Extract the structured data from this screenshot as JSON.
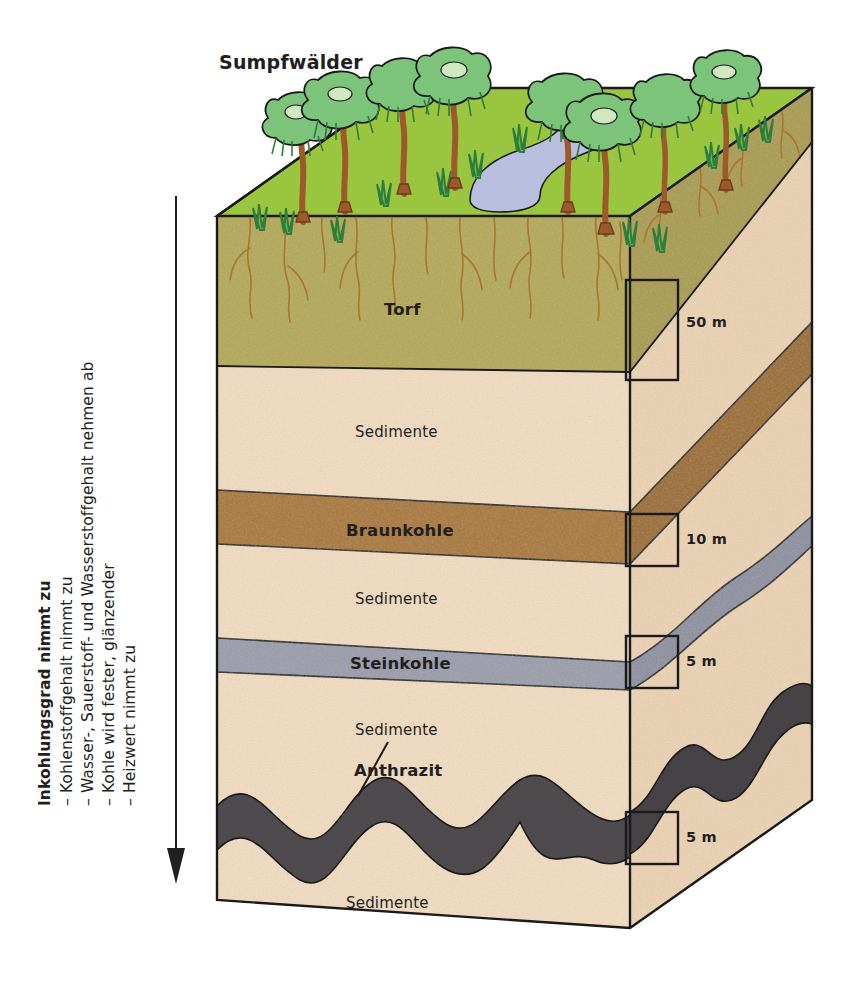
{
  "figure": {
    "title_top": "Sumpfwälder",
    "kind": "block-diagram-coal-formation"
  },
  "axis": {
    "heading": "Inkohlungsgrad nimmt zu",
    "bullets": [
      "– Kohlenstoffgehalt nimmt zu",
      "– Wasser-, Sauerstoff- und Wasserstoffgehalt nehmen ab",
      "– Kohle wird fester, glänzender",
      "– Heizwert nimmt zu"
    ],
    "arrow_direction": "down"
  },
  "layers": [
    {
      "id": "torf",
      "label": "Torf",
      "style": "bold",
      "thickness": "50 m",
      "color": "#b3a852"
    },
    {
      "id": "sed1",
      "label": "Sedimente",
      "style": "plain",
      "thickness": "",
      "color": "#f2dcc0"
    },
    {
      "id": "braunkohle",
      "label": "Braunkohle",
      "style": "bold",
      "thickness": "10 m",
      "color": "#a9772e"
    },
    {
      "id": "sed2",
      "label": "Sedimente",
      "style": "plain",
      "thickness": "",
      "color": "#f2dcc0"
    },
    {
      "id": "steinkohle",
      "label": "Steinkohle",
      "style": "bold",
      "thickness": "5 m",
      "color": "#9a9caa"
    },
    {
      "id": "sed3",
      "label": "Sedimente",
      "style": "plain",
      "thickness": "",
      "color": "#f2dcc0"
    },
    {
      "id": "anthrazit",
      "label": "Anthrazit",
      "style": "bold",
      "thickness": "5 m",
      "color": "#4f4a4e"
    },
    {
      "id": "sed4",
      "label": "Sedimente",
      "style": "plain",
      "thickness": "",
      "color": "#f2dcc0"
    }
  ],
  "depth_marks": [
    {
      "id": "mark-torf",
      "value": "50 m"
    },
    {
      "id": "mark-braunkohle",
      "value": "10 m"
    },
    {
      "id": "mark-steinkohle",
      "value": "5 m"
    },
    {
      "id": "mark-anthrazit",
      "value": "5 m"
    }
  ],
  "surface": {
    "vegetation": "swamp-forest",
    "water_body": "pond",
    "grass_color": "#9ac63f",
    "water_color": "#b9bede",
    "tree_canopy_color": "#7cc47a",
    "trunk_color": "#9c5a2b"
  },
  "colors": {
    "outline": "#1a1a1a",
    "peat": "#b3a852",
    "peat_side": "#a99b4a",
    "sediment": "#f2dcc0",
    "sediment_side": "#ecd2b2",
    "lignite": "#a9772e",
    "lignite_side": "#9c6c27",
    "hard_coal": "#9a9caa",
    "hard_coal_side": "#8e909f",
    "anthracite": "#4f4a4e",
    "anthracite_side": "#474245",
    "root": "#a8762f",
    "text": "#231f20"
  }
}
